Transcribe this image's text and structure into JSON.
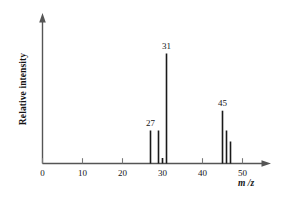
{
  "chart_data": {
    "type": "bar",
    "title": "",
    "subtitle": "",
    "xlabel": "m /z",
    "ylabel": "Relative intensity",
    "xlim": [
      0,
      56
    ],
    "ylim": [
      0,
      100
    ],
    "grid": false,
    "legend": null,
    "xticks": [
      0,
      10,
      20,
      30,
      40,
      50
    ],
    "xticklabels": [
      "0",
      "10",
      "20",
      "30",
      "40",
      "50"
    ],
    "yticks": [],
    "yticklabels": [],
    "x": [
      27,
      29,
      30,
      31,
      45,
      46,
      47
    ],
    "values": [
      30,
      30,
      5,
      100,
      48,
      30,
      20
    ],
    "bars": [
      {
        "mz": 27,
        "intensity": 30
      },
      {
        "mz": 29,
        "intensity": 30
      },
      {
        "mz": 30,
        "intensity": 5
      },
      {
        "mz": 31,
        "intensity": 100
      },
      {
        "mz": 45,
        "intensity": 48
      },
      {
        "mz": 46,
        "intensity": 30
      },
      {
        "mz": 47,
        "intensity": 20
      }
    ],
    "annotations": [
      {
        "text": "27",
        "mz": 27,
        "intensity": 30
      },
      {
        "text": "31",
        "mz": 31,
        "intensity": 100
      },
      {
        "text": "45",
        "mz": 45,
        "intensity": 48
      }
    ],
    "colors": {
      "bar": "#1a1a1a",
      "axis": "#4d4d4d",
      "text": "#141414",
      "background": "#ffffff"
    }
  },
  "axes": {
    "y_label": "Relative intensity",
    "x_label": "m /z"
  }
}
